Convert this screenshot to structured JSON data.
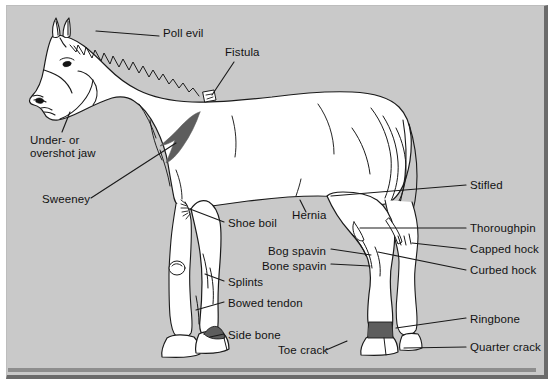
{
  "figure": {
    "colors": {
      "panel_background": "#c9c9c9",
      "page_background": "#ffffff",
      "panel_shadow": "#6b6b6b",
      "line": "#1a1a1a",
      "body_fill": "#ffffff",
      "dark_marking": "#5d5d5d",
      "text": "#121212"
    }
  },
  "labels": [
    {
      "id": "poll-evil",
      "text": "Poll evil",
      "x": 163,
      "y": 33,
      "align": "left"
    },
    {
      "id": "fistula",
      "text": "Fistula",
      "x": 225,
      "y": 52,
      "align": "left"
    },
    {
      "id": "under-overshot-jaw",
      "text": "Under- or\novershot jaw",
      "x": 30,
      "y": 140,
      "align": "left"
    },
    {
      "id": "sweeney",
      "text": "Sweeney",
      "x": 43,
      "y": 200,
      "align": "left"
    },
    {
      "id": "shoe-boil",
      "text": "Shoe boil",
      "x": 228,
      "y": 224,
      "align": "left"
    },
    {
      "id": "hernia",
      "text": "Hernia",
      "x": 292,
      "y": 216,
      "align": "left"
    },
    {
      "id": "bog-spavin",
      "text": "Bog spavin",
      "x": 268,
      "y": 252,
      "align": "left"
    },
    {
      "id": "bone-spavin",
      "text": "Bone spavin",
      "x": 263,
      "y": 267,
      "align": "left"
    },
    {
      "id": "splints",
      "text": "Splints",
      "x": 228,
      "y": 283,
      "align": "left"
    },
    {
      "id": "bowed-tendon",
      "text": "Bowed tendon",
      "x": 228,
      "y": 304,
      "align": "left"
    },
    {
      "id": "side-bone",
      "text": "Side bone",
      "x": 228,
      "y": 336,
      "align": "left"
    },
    {
      "id": "toe-crack",
      "text": "Toe crack",
      "x": 278,
      "y": 351,
      "align": "left"
    },
    {
      "id": "stifled",
      "text": "Stifled",
      "x": 470,
      "y": 186,
      "align": "left"
    },
    {
      "id": "thoroughpin",
      "text": "Thoroughpin",
      "x": 470,
      "y": 229,
      "align": "left"
    },
    {
      "id": "capped-hock",
      "text": "Capped hock",
      "x": 470,
      "y": 250,
      "align": "left"
    },
    {
      "id": "curbed-hock",
      "text": "Curbed hock",
      "x": 470,
      "y": 272,
      "align": "left"
    },
    {
      "id": "ringbone",
      "text": "Ringbone",
      "x": 470,
      "y": 320,
      "align": "left"
    },
    {
      "id": "quarter-crack",
      "text": "Quarter crack",
      "x": 470,
      "y": 348,
      "align": "left"
    }
  ],
  "leader_lines": [
    {
      "id": "poll-evil-leader",
      "points": "159,36 96,31"
    },
    {
      "id": "fistula-leader",
      "points": "232,62 211,96"
    },
    {
      "id": "under-overshot-jaw-leader",
      "points": "62,133 70,113"
    },
    {
      "id": "sweeney-leader",
      "points": "91,198 175,144"
    },
    {
      "id": "shoe-boil-leader",
      "points": "224,222 191,209"
    },
    {
      "id": "hernia-leader",
      "points": "305,212 298,201"
    },
    {
      "id": "bog-spavin-leader",
      "points": "330,249 370,256"
    },
    {
      "id": "bone-spavin-leader",
      "points": "330,264 369,266"
    },
    {
      "id": "splints-leader",
      "points": "224,281 204,274"
    },
    {
      "id": "bowed-tendon-leader",
      "points": "224,302 195,310"
    },
    {
      "id": "side-bone-leader",
      "points": "224,334 209,338"
    },
    {
      "id": "toe-crack-leader",
      "points": "325,350 345,341"
    },
    {
      "id": "stifled-leader",
      "points": "466,185 331,196"
    },
    {
      "id": "thoroughpin-leader",
      "points": "466,228 388,228"
    },
    {
      "id": "capped-hock-leader",
      "points": "466,249 434,243"
    },
    {
      "id": "curbed-hock-leader",
      "points": "466,270 400,254"
    },
    {
      "id": "ringbone-leader",
      "points": "466,318 410,330"
    },
    {
      "id": "quarter-crack-leader",
      "points": "466,347 414,346"
    }
  ],
  "markings": [
    {
      "id": "shoulder-shade",
      "description": "dark shoulder marking"
    },
    {
      "id": "nostril-dark",
      "description": "dark nostril"
    },
    {
      "id": "eye-dark",
      "description": "dark eye"
    },
    {
      "id": "side-bone-dark",
      "description": "dark side bone area on front hoof"
    },
    {
      "id": "ringbone-dark",
      "description": "dark ringbone band on rear pastern"
    },
    {
      "id": "fistula-mark",
      "description": "small boxed fistula mark at withers"
    },
    {
      "id": "shoe-boil-mark",
      "description": "hatched shoe boil mark at elbow"
    }
  ]
}
